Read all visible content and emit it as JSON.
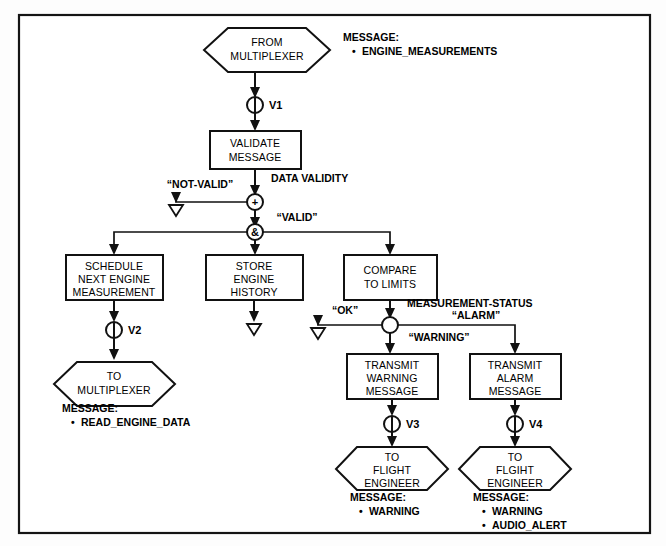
{
  "diagram": {
    "type": "data-flow-diagram",
    "frame": {
      "border_color": "#141414",
      "background": "#ffffff"
    },
    "nodes": [
      {
        "id": "from-multiplexer",
        "shape": "hexagon",
        "lines": [
          "FROM",
          "MULTIPLEXER"
        ],
        "x": 267,
        "y": 50
      },
      {
        "id": "validate-message",
        "shape": "rect",
        "lines": [
          "VALIDATE",
          "MESSAGE"
        ],
        "x": 255,
        "y": 150
      },
      {
        "id": "schedule-next-engine-measurement",
        "shape": "rect",
        "lines": [
          "SCHEDULE",
          "NEXT ENGINE",
          "MEASUREMENT"
        ],
        "x": 114,
        "y": 276
      },
      {
        "id": "store-engine-history",
        "shape": "rect",
        "lines": [
          "STORE",
          "ENGINE",
          "HISTORY"
        ],
        "x": 254,
        "y": 276
      },
      {
        "id": "compare-to-limits",
        "shape": "rect",
        "lines": [
          "COMPARE",
          "TO LIMITS"
        ],
        "x": 390,
        "y": 276
      },
      {
        "id": "to-multiplexer",
        "shape": "hexagon",
        "lines": [
          "TO",
          "MULTIPLEXER"
        ],
        "x": 114,
        "y": 384
      },
      {
        "id": "transmit-warning-message",
        "shape": "rect",
        "lines": [
          "TRANSMIT",
          "WARNING",
          "MESSAGE"
        ],
        "x": 392,
        "y": 375
      },
      {
        "id": "transmit-alarm-message",
        "shape": "rect",
        "lines": [
          "TRANSMIT",
          "ALARM",
          "MESSAGE"
        ],
        "x": 515,
        "y": 375
      },
      {
        "id": "to-flight-engineer-warning",
        "shape": "hexagon",
        "lines": [
          "TO",
          "FLIGHT",
          "ENGINEER"
        ],
        "x": 392,
        "y": 466
      },
      {
        "id": "to-flight-engineer-alarm",
        "shape": "hexagon",
        "lines": [
          "TO",
          "FLGIHT",
          "ENGINEER"
        ],
        "x": 515,
        "y": 466
      }
    ],
    "valves": [
      {
        "id": "v1",
        "label": "V1",
        "x": 255,
        "y": 105
      },
      {
        "id": "v2",
        "label": "V2",
        "x": 114,
        "y": 330
      },
      {
        "id": "v3",
        "label": "V3",
        "x": 392,
        "y": 424
      },
      {
        "id": "v4",
        "label": "V4",
        "x": 515,
        "y": 424
      }
    ],
    "junctions": [
      {
        "id": "plus-junction",
        "symbol": "+",
        "x": 255,
        "y": 202
      },
      {
        "id": "and-junction",
        "symbol": "&",
        "x": 255,
        "y": 232
      },
      {
        "id": "status-junction",
        "symbol": "",
        "x": 392,
        "y": 325
      }
    ],
    "sinks": [
      {
        "id": "not-valid-sink",
        "x": 176,
        "y": 205
      },
      {
        "id": "store-history-sink",
        "x": 254,
        "y": 325
      },
      {
        "id": "ok-sink",
        "x": 318,
        "y": 328
      }
    ],
    "flow_labels": [
      {
        "id": "data-validity",
        "text": "DATA VALIDITY",
        "x": 271,
        "y": 182,
        "anchor": "start"
      },
      {
        "id": "not-valid",
        "text": "“NOT-VALID”",
        "x": 200,
        "y": 188,
        "anchor": "middle"
      },
      {
        "id": "valid",
        "text": "“VALID”",
        "x": 297,
        "y": 221,
        "anchor": "middle"
      },
      {
        "id": "measurement-status",
        "text": "MEASUREMENT-STATUS",
        "x": 407,
        "y": 307,
        "anchor": "start"
      },
      {
        "id": "ok",
        "text": "“OK”",
        "x": 345,
        "y": 314,
        "anchor": "middle"
      },
      {
        "id": "alarm",
        "text": "“ALARM”",
        "x": 476,
        "y": 319,
        "anchor": "middle"
      },
      {
        "id": "warning",
        "text": "“WARNING”",
        "x": 439,
        "y": 341,
        "anchor": "middle"
      }
    ],
    "message_blocks": [
      {
        "id": "message-engine-measurements",
        "heading": "MESSAGE:",
        "items": [
          "ENGINE_MEASUREMENTS"
        ],
        "x": 343,
        "y": 41
      },
      {
        "id": "message-read-engine-data",
        "heading": "MESSAGE:",
        "items": [
          "READ_ENGINE_DATA"
        ],
        "x": 62,
        "y": 412
      },
      {
        "id": "message-warning",
        "heading": "MESSAGE:",
        "items": [
          "WARNING"
        ],
        "x": 350,
        "y": 493
      },
      {
        "id": "message-warning-audio-alert",
        "heading": "MESSAGE:",
        "items": [
          "WARNING",
          "AUDIO_ALERT"
        ],
        "x": 473,
        "y": 493
      }
    ]
  }
}
